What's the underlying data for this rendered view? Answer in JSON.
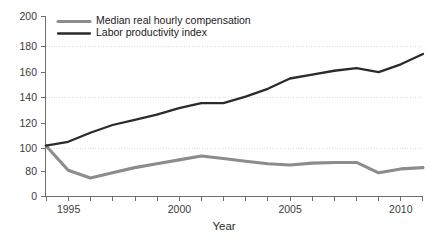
{
  "chart_data": {
    "type": "line",
    "title": "",
    "xlabel": "Year",
    "ylabel": "",
    "xlim": [
      1994,
      2011
    ],
    "ylim": [
      70,
      200
    ],
    "grid": true,
    "grid_values": [
      100,
      140,
      180
    ],
    "legend_position": "top-left-inside",
    "y_ticks": [
      0,
      80,
      100,
      120,
      140,
      160,
      180,
      200
    ],
    "y_tick_labels": [
      "0",
      "80",
      "100",
      "120",
      "140",
      "160",
      "180",
      "200"
    ],
    "y_axis_broken": true,
    "x_ticks": [
      1994,
      1995,
      1996,
      1997,
      1998,
      1999,
      2000,
      2001,
      2002,
      2003,
      2004,
      2005,
      2006,
      2007,
      2008,
      2009,
      2010,
      2011
    ],
    "x_tick_labels": [
      "",
      "1995",
      "",
      "",
      "",
      "",
      "2000",
      "",
      "",
      "",
      "",
      "2005",
      "",
      "",
      "",
      "",
      "2010",
      ""
    ],
    "x": [
      1994,
      1995,
      1996,
      1997,
      1998,
      1999,
      2000,
      2001,
      2002,
      2003,
      2004,
      2005,
      2006,
      2007,
      2008,
      2009,
      2010,
      2011
    ],
    "series": [
      {
        "name": "Median real hourly compensation",
        "color": "#8c8c8c",
        "line_width": 3.1,
        "values": [
          100,
          81,
          75,
          79,
          83,
          86,
          89,
          92,
          90,
          88,
          86,
          85,
          86.5,
          87,
          87,
          79,
          82,
          83
        ]
      },
      {
        "name": "Labor productivity index",
        "color": "#2b2b2b",
        "line_width": 2.3,
        "values": [
          100,
          103,
          110,
          116,
          120,
          124,
          129,
          133,
          133,
          138,
          144,
          152,
          155,
          158,
          160,
          157,
          163,
          171
        ]
      }
    ]
  },
  "legend": {
    "items": [
      {
        "label": "Median real hourly compensation",
        "color": "#8c8c8c"
      },
      {
        "label": "Labor productivity index",
        "color": "#2b2b2b"
      }
    ]
  },
  "axes": {
    "x_title": "Year",
    "y_tick_0": "0",
    "y_tick_80": "80",
    "y_tick_100": "100",
    "y_tick_120": "120",
    "y_tick_140": "140",
    "y_tick_160": "160",
    "y_tick_180": "180",
    "y_tick_200": "200",
    "x_tick_1995": "1995",
    "x_tick_2000": "2000",
    "x_tick_2005": "2005",
    "x_tick_2010": "2010"
  },
  "colors": {
    "series_compensation": "#8c8c8c",
    "series_productivity": "#2b2b2b",
    "axis": "#6e6e6e",
    "grid": "#dedede",
    "background": "#ffffff"
  }
}
